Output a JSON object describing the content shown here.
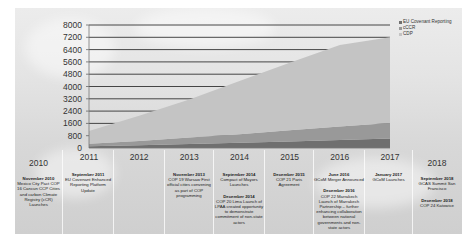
{
  "chart_data": {
    "type": "area",
    "title": "",
    "xlabel": "",
    "ylabel": "",
    "x": [
      2011,
      2012,
      2013,
      2014,
      2015,
      2016,
      2017
    ],
    "x_tick_labels": [
      "2011",
      "2012",
      "2013",
      "2014",
      "2015",
      "2016",
      "2017"
    ],
    "y_tick_labels": [
      "0",
      "800",
      "1600",
      "2400",
      "3200",
      "4000",
      "4800",
      "5600",
      "6400",
      "7200",
      "8000"
    ],
    "ylim": [
      0,
      8000
    ],
    "grid": true,
    "legend_position": "right",
    "stacked": true,
    "series": [
      {
        "name": "EU Covenant Reporting",
        "color": "#6f6f6f",
        "values": [
          120,
          180,
          260,
          340,
          430,
          520,
          620
        ]
      },
      {
        "name": "cCCR",
        "color": "#999999",
        "values": [
          150,
          280,
          420,
          560,
          720,
          880,
          1000
        ]
      },
      {
        "name": "CDP",
        "color": "#c4c4c4",
        "values": [
          830,
          1640,
          2470,
          3450,
          4400,
          5300,
          5580
        ]
      }
    ],
    "cumulative_top": [
      1100,
      2100,
      3150,
      4350,
      5550,
      6700,
      7200
    ]
  },
  "legend": {
    "items": [
      {
        "label": "EU Covenant Reporting",
        "color": "#6f6f6f"
      },
      {
        "label": "cCCR",
        "color": "#999999"
      },
      {
        "label": "CDP",
        "color": "#c4c4c4"
      }
    ]
  },
  "timeline": {
    "columns": [
      {
        "year": "2010",
        "events": [
          {
            "date": "November 2010",
            "text": "Mexico City Pact COP 16 Cancun CCP Cities and carbon Climate Registry (cCR) Launches"
          }
        ]
      },
      {
        "year": "2011",
        "events": [
          {
            "date": "September 2011",
            "text": "EU Covenant Enhanced Reporting Platform Update"
          }
        ]
      },
      {
        "year": "2012",
        "events": []
      },
      {
        "year": "2013",
        "events": [
          {
            "date": "November 2013",
            "text": "COP 19 Warsaw First official cities convening as part of COP programming"
          }
        ]
      },
      {
        "year": "2014",
        "events": [
          {
            "date": "September 2014",
            "text": "Compact of Mayors Launches"
          },
          {
            "date": "December 2014",
            "text": "COP 20 Lima Launch of LPAA created opportunity to demonstrate commitment of non-state actors"
          }
        ]
      },
      {
        "year": "2015",
        "events": [
          {
            "date": "December 2015",
            "text": "COP 21 Paris Agreement"
          }
        ]
      },
      {
        "year": "2016",
        "events": [
          {
            "date": "June 2016",
            "text": "GCoM Merger Announced"
          },
          {
            "date": "December 2016",
            "text": "COP 22 Marrakech Launch of Marrakech Partnership – further enhancing collaboration between national governments and non-state actors"
          }
        ]
      },
      {
        "year": "2017",
        "events": [
          {
            "date": "January 2017",
            "text": "GCoM Launches"
          }
        ]
      },
      {
        "year": "2018",
        "events": [
          {
            "date": "September 2018",
            "text": "GCAS Summit San Francisco"
          },
          {
            "date": "December 2018",
            "text": "COP 24 Katowice"
          }
        ]
      }
    ]
  }
}
